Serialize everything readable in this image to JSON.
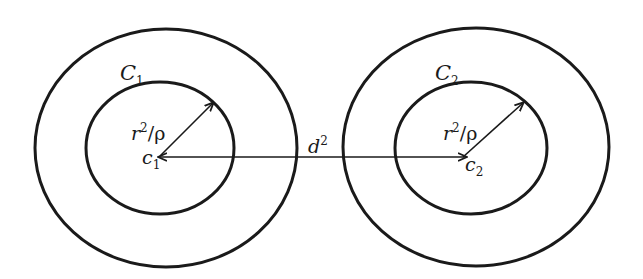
{
  "diagram": {
    "type": "concentric-circles-distance",
    "colors": {
      "stroke": "#1a1a1a",
      "background": "#ffffff"
    },
    "left_group": {
      "outer_circle": {
        "cx": 166,
        "cy": 148,
        "rx": 131,
        "ry": 119
      },
      "inner_circle": {
        "cx": 160,
        "cy": 148,
        "rx": 74,
        "ry": 66
      },
      "outer_label": {
        "base": "C",
        "subscript": "1"
      },
      "center_label": {
        "base": "c",
        "subscript": "1"
      },
      "radius_label": {
        "base": "r",
        "superscript": "2",
        "slash": "/",
        "rho": "ρ"
      },
      "radius_arrow": {
        "x1": 160,
        "y1": 156,
        "x2": 213,
        "y2": 103
      }
    },
    "right_group": {
      "outer_circle": {
        "cx": 476,
        "cy": 147,
        "rx": 133,
        "ry": 119
      },
      "inner_circle": {
        "cx": 471,
        "cy": 148,
        "rx": 76,
        "ry": 66
      },
      "outer_label": {
        "base": "C",
        "subscript": "2"
      },
      "center_label": {
        "base": "c",
        "subscript": "2"
      },
      "radius_label": {
        "base": "r",
        "superscript": "2",
        "slash": "/",
        "rho": "ρ"
      },
      "radius_arrow": {
        "x1": 463,
        "y1": 157,
        "x2": 523,
        "y2": 103
      }
    },
    "distance_arrow": {
      "x1": 159,
      "y1": 157,
      "x2": 466,
      "y2": 157,
      "label": {
        "base": "d",
        "superscript": "2"
      }
    }
  }
}
